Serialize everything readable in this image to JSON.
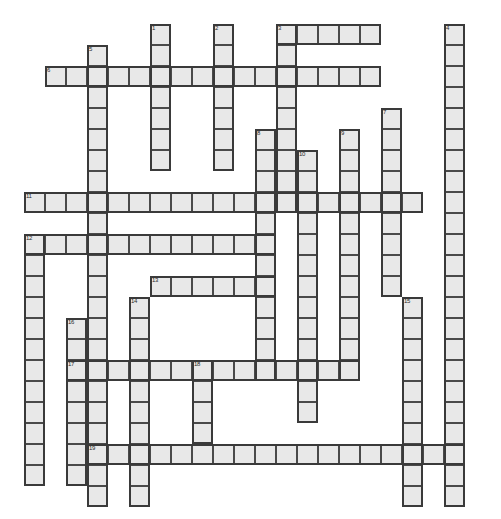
{
  "puzzle": {
    "title": "Crossword Puzzle Grid",
    "type": "crossword",
    "width_px": 501,
    "height_px": 519,
    "cell_size_px": 21,
    "origin_x_px": 24,
    "origin_y_px": 24,
    "columns": 23,
    "rows": 23,
    "cell_fill_color": "#e8e8e8",
    "cell_border_color": "#4a4a4a",
    "word_outline_color": "#3a3a3a",
    "background_color": "#ffffff",
    "number_color": "#2b2b2b",
    "entries": [
      {
        "number": "1",
        "direction": "down",
        "col": 6,
        "row": 0,
        "length": 7
      },
      {
        "number": "2",
        "direction": "down",
        "col": 9,
        "row": 0,
        "length": 7
      },
      {
        "number": "3",
        "direction": "across",
        "col": 12,
        "row": 0,
        "length": 5
      },
      {
        "number": "3",
        "direction": "down",
        "col": 12,
        "row": 0,
        "length": 9
      },
      {
        "number": "4",
        "direction": "down",
        "col": 20,
        "row": 0,
        "length": 23
      },
      {
        "number": "5",
        "direction": "down",
        "col": 3,
        "row": 1,
        "length": 22
      },
      {
        "number": "6",
        "direction": "across",
        "col": 1,
        "row": 2,
        "length": 16
      },
      {
        "number": "7",
        "direction": "down",
        "col": 17,
        "row": 4,
        "length": 9
      },
      {
        "number": "8",
        "direction": "down",
        "col": 11,
        "row": 5,
        "length": 12
      },
      {
        "number": "9",
        "direction": "down",
        "col": 15,
        "row": 5,
        "length": 12
      },
      {
        "number": "10",
        "direction": "down",
        "col": 13,
        "row": 6,
        "length": 13
      },
      {
        "number": "11",
        "direction": "across",
        "col": 0,
        "row": 8,
        "length": 19
      },
      {
        "number": "12",
        "direction": "across",
        "col": 0,
        "row": 10,
        "length": 12
      },
      {
        "number": "12",
        "direction": "down",
        "col": 0,
        "row": 10,
        "length": 12
      },
      {
        "number": "13",
        "direction": "across",
        "col": 6,
        "row": 12,
        "length": 6
      },
      {
        "number": "14",
        "direction": "down",
        "col": 5,
        "row": 13,
        "length": 10
      },
      {
        "number": "15",
        "direction": "down",
        "col": 18,
        "row": 13,
        "length": 10
      },
      {
        "number": "16",
        "direction": "down",
        "col": 2,
        "row": 14,
        "length": 8
      },
      {
        "number": "17",
        "direction": "across",
        "col": 2,
        "row": 16,
        "length": 14
      },
      {
        "number": "18",
        "direction": "down",
        "col": 8,
        "row": 16,
        "length": 4
      },
      {
        "number": "19",
        "direction": "across",
        "col": 3,
        "row": 20,
        "length": 18
      }
    ]
  }
}
